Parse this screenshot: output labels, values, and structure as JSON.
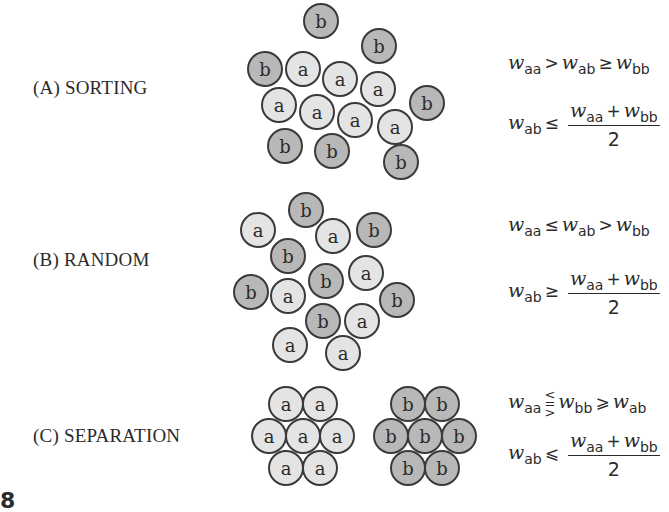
{
  "figure_number": "8",
  "panels": [
    {
      "id": "A",
      "label": "(A)  SORTING",
      "cells": [
        {
          "t": "b",
          "x": 321,
          "y": 21
        },
        {
          "t": "b",
          "x": 379,
          "y": 46
        },
        {
          "t": "b",
          "x": 265,
          "y": 69
        },
        {
          "t": "a",
          "x": 303,
          "y": 69
        },
        {
          "t": "a",
          "x": 340,
          "y": 79
        },
        {
          "t": "a",
          "x": 378,
          "y": 89
        },
        {
          "t": "a",
          "x": 279,
          "y": 105
        },
        {
          "t": "a",
          "x": 317,
          "y": 112
        },
        {
          "t": "a",
          "x": 355,
          "y": 120
        },
        {
          "t": "a",
          "x": 395,
          "y": 127
        },
        {
          "t": "b",
          "x": 427,
          "y": 103
        },
        {
          "t": "b",
          "x": 285,
          "y": 146
        },
        {
          "t": "b",
          "x": 332,
          "y": 151
        },
        {
          "t": "b",
          "x": 401,
          "y": 162
        }
      ],
      "eq1": {
        "l": "aa",
        "op1": ">",
        "m": "ab",
        "op2": "≥",
        "r": "bb"
      },
      "eq2": {
        "l": "ab",
        "op": "≤",
        "num_l": "aa",
        "num_r": "bb",
        "den": "2"
      }
    },
    {
      "id": "B",
      "label": "(B)  RANDOM",
      "cells": [
        {
          "t": "b",
          "x": 306,
          "y": 210
        },
        {
          "t": "a",
          "x": 258,
          "y": 230
        },
        {
          "t": "a",
          "x": 333,
          "y": 236
        },
        {
          "t": "b",
          "x": 374,
          "y": 230
        },
        {
          "t": "b",
          "x": 288,
          "y": 256
        },
        {
          "t": "b",
          "x": 251,
          "y": 292
        },
        {
          "t": "a",
          "x": 288,
          "y": 296
        },
        {
          "t": "b",
          "x": 326,
          "y": 281
        },
        {
          "t": "a",
          "x": 366,
          "y": 273
        },
        {
          "t": "b",
          "x": 397,
          "y": 300
        },
        {
          "t": "b",
          "x": 323,
          "y": 321
        },
        {
          "t": "a",
          "x": 362,
          "y": 321
        },
        {
          "t": "a",
          "x": 290,
          "y": 345
        },
        {
          "t": "a",
          "x": 343,
          "y": 353
        }
      ],
      "eq1": {
        "l": "aa",
        "op1": "≤",
        "m": "ab",
        "op2": ">",
        "r": "bb"
      },
      "eq2": {
        "l": "ab",
        "op": "≥",
        "num_l": "aa",
        "num_r": "bb",
        "den": "2"
      }
    },
    {
      "id": "C",
      "label": "(C)  SEPARATION",
      "cells": [
        {
          "t": "a",
          "x": 286,
          "y": 404
        },
        {
          "t": "a",
          "x": 320,
          "y": 404
        },
        {
          "t": "a",
          "x": 269,
          "y": 436
        },
        {
          "t": "a",
          "x": 303,
          "y": 436
        },
        {
          "t": "a",
          "x": 337,
          "y": 436
        },
        {
          "t": "a",
          "x": 286,
          "y": 468
        },
        {
          "t": "a",
          "x": 320,
          "y": 468
        },
        {
          "t": "b",
          "x": 408,
          "y": 404
        },
        {
          "t": "b",
          "x": 442,
          "y": 404
        },
        {
          "t": "b",
          "x": 391,
          "y": 436
        },
        {
          "t": "b",
          "x": 425,
          "y": 436
        },
        {
          "t": "b",
          "x": 459,
          "y": 436
        },
        {
          "t": "b",
          "x": 408,
          "y": 468
        },
        {
          "t": "b",
          "x": 442,
          "y": 468
        }
      ],
      "eq1": {
        "l": "aa",
        "op1": "≶",
        "m": "bb",
        "op2": "⩾",
        "r": "ab"
      },
      "eq2": {
        "l": "ab",
        "op": "⩽",
        "num_l": "aa",
        "num_r": "bb",
        "den": "2"
      }
    }
  ],
  "legend": {
    "w": "w",
    "plus": "+"
  }
}
